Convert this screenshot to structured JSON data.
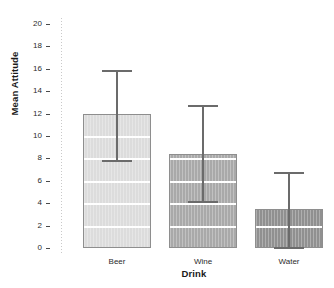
{
  "chart_data": {
    "type": "bar",
    "title": "",
    "subtitle": "",
    "xlabel": "Drink",
    "ylabel": "Mean Attitude",
    "categories": [
      "Beer",
      "Wine",
      "Water"
    ],
    "values": [
      12.0,
      8.4,
      3.5
    ],
    "series": [
      {
        "name": "Mean Attitude",
        "values": [
          12.0,
          8.4,
          3.5
        ],
        "error_low": [
          7.85,
          4.2,
          0.1
        ],
        "error_high": [
          15.9,
          12.8,
          6.8
        ]
      }
    ],
    "ylim": [
      0,
      20
    ],
    "xlim_categories": 3,
    "ytick_labels": [
      "0",
      "2",
      "4",
      "6",
      "8",
      "10",
      "12",
      "14",
      "16",
      "18",
      "20"
    ],
    "ytick_values": [
      0,
      2,
      4,
      6,
      8,
      10,
      12,
      14,
      16,
      18,
      20
    ],
    "grid": "horizontal-white-inside-bars",
    "legend": "none",
    "error_bar_type": "95% CI",
    "bar_colors": [
      "#dcdcdc",
      "#a9a9a9",
      "#909090"
    ],
    "bar_border_color": "#8e8e8e",
    "error_bar_color": "#6b6b6b",
    "gridline_color": "#ffffff",
    "axis_text_color": "#2b2b2b",
    "background_color": "#ffffff"
  },
  "axes": {
    "y_title": "Mean Attitude",
    "x_title": "Drink"
  }
}
